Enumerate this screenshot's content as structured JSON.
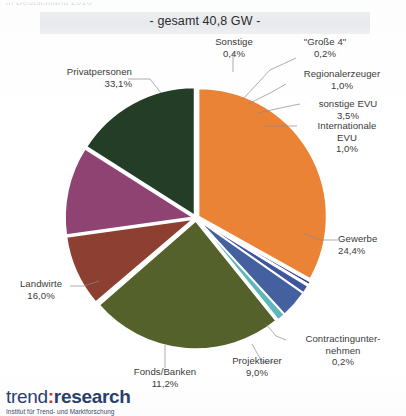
{
  "header": {
    "cut_off_text": "in Deutschland 2010"
  },
  "title": {
    "band_text": "- gesamt 40,8 GW -"
  },
  "logo": {
    "word_part1": "trend",
    "separator": ":",
    "word_part2": "research",
    "subtitle": "Institut für Trend- und Marktforschung",
    "color_primary": "#2a3f6d",
    "color_accent": "#c0392b"
  },
  "chart_data": {
    "type": "pie",
    "title": "- gesamt 40,8 GW -",
    "total_label": "gesamt 40,8 GW",
    "total_value": 40.8,
    "total_unit": "GW",
    "legend": "none",
    "labels_inline": true,
    "categories": [
      "Privatpersonen",
      "Sonstige",
      "\"Große 4\"",
      "Regionalerzeuger",
      "sonstige EVU",
      "Internationale EVU",
      "Gewerbe",
      "Contractingunternehmen",
      "Projektierer",
      "Fonds/Banken",
      "Landwirte"
    ],
    "values": [
      33.1,
      0.4,
      0.2,
      1.0,
      3.5,
      1.0,
      24.4,
      0.2,
      9.0,
      11.2,
      16.0
    ],
    "value_labels": [
      "33,1%",
      "0,4%",
      "0,2%",
      "1,0%",
      "3,5%",
      "1,0%",
      "24,4%",
      "0,2%",
      "9,0%",
      "11,2%",
      "16,0%"
    ],
    "colors": [
      "#ea8336",
      "#2c3f86",
      "#3c4f95",
      "#3e55a0",
      "#45609f",
      "#5fb6bb",
      "#55612a",
      "#6a3d2f",
      "#8d3f31",
      "#8e4372",
      "#243d26"
    ],
    "slices": [
      {
        "name": "Privatpersonen",
        "value": 33.1,
        "label": "33,1%",
        "color": "#ea8336"
      },
      {
        "name": "Sonstige",
        "value": 0.4,
        "label": "0,4%",
        "color": "#2c3f86"
      },
      {
        "name": "\"Große 4\"",
        "value": 0.2,
        "label": "0,2%",
        "color": "#3c4f95"
      },
      {
        "name": "Regionalerzeuger",
        "value": 1.0,
        "label": "1,0%",
        "color": "#3e55a0"
      },
      {
        "name": "sonstige EVU",
        "value": 3.5,
        "label": "3,5%",
        "color": "#45609f"
      },
      {
        "name": "Internationale EVU",
        "value": 1.0,
        "label": "1,0%",
        "color": "#5fb6bb"
      },
      {
        "name": "Gewerbe",
        "value": 24.4,
        "label": "24,4%",
        "color": "#55612a"
      },
      {
        "name": "Contractingunternehmen",
        "value": 0.2,
        "label": "0,2%",
        "color": "#6a3d2f"
      },
      {
        "name": "Projektierer",
        "value": 9.0,
        "label": "9,0%",
        "color": "#8d3f31"
      },
      {
        "name": "Fonds/Banken",
        "value": 11.2,
        "label": "11,2%",
        "color": "#8e4372"
      },
      {
        "name": "Landwirte",
        "value": 16.0,
        "label": "16,0%",
        "color": "#243d26"
      }
    ]
  },
  "labels": {
    "privatpersonen": {
      "name": "Privatpersonen",
      "value": "33,1%"
    },
    "sonstige": {
      "name": "Sonstige",
      "value": "0,4%"
    },
    "grosse4": {
      "name": "\"Große 4\"",
      "value": "0,2%"
    },
    "regionalerzeuger": {
      "name": "Regionalerzeuger",
      "value": "1,0%"
    },
    "sonstige_evu": {
      "name": "sonstige EVU",
      "value": "3,5%"
    },
    "internationale_evu": {
      "name": "Internationale",
      "name2": "EVU",
      "value": "1,0%"
    },
    "gewerbe": {
      "name": "Gewerbe",
      "value": "24,4%"
    },
    "contracting": {
      "name": "Contractingunter-",
      "name2": "nehmen",
      "value": "0,2%"
    },
    "projektierer": {
      "name": "Projektierer",
      "value": "9,0%"
    },
    "fonds_banken": {
      "name": "Fonds/Banken",
      "value": "11,2%"
    },
    "landwirte": {
      "name": "Landwirte",
      "value": "16,0%"
    }
  }
}
